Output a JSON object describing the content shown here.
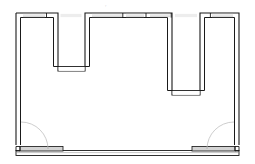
{
  "drawing": {
    "type": "architectural-floor-plan",
    "title": "Floor Plan",
    "canvas": {
      "width": 255,
      "height": 164
    },
    "background_color": "#ffffff",
    "line_color": "#1a1a1a",
    "wall_fill_color": "#d9d9d9",
    "opening_fill_color": "#efefef",
    "door_arc_color": "#b5b5b5",
    "stroke_width": 1.1,
    "thin_stroke_width": 0.6
  },
  "annotations": {
    "top_center_mark": "◦"
  },
  "geometry": {
    "outer_outline": "M 16 13 L 16 148 L 239 148 L 239 13 Z",
    "wall_path_outer": "M 16 13 L 239 13 L 239 148 L 16 148 Z",
    "perimeter_inner": "M 22 19 L 233 19 L 233 142 L 22 142 Z",
    "recess_left": {
      "x_left": 58,
      "x_right": 85,
      "depth_y": 71,
      "top_y": 13
    },
    "recess_right": {
      "x_left": 172,
      "x_right": 200,
      "depth_y": 95,
      "top_y": 13
    },
    "doors": [
      {
        "name": "door-bottom-left",
        "hinge_x": 16,
        "hinge_y": 122,
        "radius": 28,
        "swing": "down-right"
      },
      {
        "name": "door-bottom-right",
        "hinge_x": 239,
        "hinge_y": 122,
        "radius": 28,
        "swing": "down-left"
      }
    ],
    "windows_top": [
      {
        "x": 23,
        "width": 22
      },
      {
        "x": 60,
        "width": 22
      },
      {
        "x": 92,
        "width": 30
      },
      {
        "x": 126,
        "width": 18
      },
      {
        "x": 150,
        "width": 20
      },
      {
        "x": 175,
        "width": 22
      },
      {
        "x": 212,
        "width": 21
      }
    ]
  },
  "labels": {
    "plan_name": "",
    "scale": "",
    "north_mark": ""
  }
}
